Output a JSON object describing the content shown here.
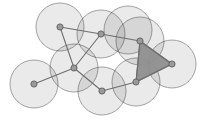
{
  "figure": {
    "name": "disk-cover-simplicial-complex",
    "width": 206,
    "height": 126,
    "background": "#ffffff",
    "caption": ""
  },
  "style": {
    "disk_fill": "#e6e6e6",
    "disk_stroke": "#8c8c8c",
    "disk_stroke_width": 0.8,
    "disk_opacity": 0.85,
    "edge_stroke": "#6e6e6e",
    "edge_width": 1.1,
    "vertex_fill": "#9a9a9a",
    "vertex_stroke": "#5f5f5f",
    "vertex_radius": 3.1,
    "triangle_fill": "#8f8f8f",
    "triangle_stroke": "#6e6e6e",
    "triangle_opacity": 0.95
  },
  "chart_data": {
    "type": "scatter",
    "title": "",
    "xlabel": "",
    "ylabel": "",
    "grid": false,
    "legend": null,
    "xlim": [
      0,
      206
    ],
    "ylim": [
      0,
      126
    ],
    "radius": 24,
    "vertices": [
      {
        "id": "v1",
        "label": "v1",
        "x": 60,
        "y": 27
      },
      {
        "id": "v2",
        "label": "v2",
        "x": 101,
        "y": 34
      },
      {
        "id": "v3",
        "label": "v3",
        "x": 140,
        "y": 41
      },
      {
        "id": "v4",
        "label": "v4",
        "x": 172,
        "y": 64
      },
      {
        "id": "v5",
        "label": "v5",
        "x": 136,
        "y": 82
      },
      {
        "id": "v6",
        "label": "v6",
        "x": 102,
        "y": 91
      },
      {
        "id": "v7",
        "label": "v7",
        "x": 74,
        "y": 68
      },
      {
        "id": "v8",
        "label": "v8",
        "x": 34,
        "y": 84
      }
    ],
    "edges": [
      {
        "from": "v1",
        "to": "v2"
      },
      {
        "from": "v2",
        "to": "v3"
      },
      {
        "from": "v3",
        "to": "v4"
      },
      {
        "from": "v3",
        "to": "v5"
      },
      {
        "from": "v4",
        "to": "v5"
      },
      {
        "from": "v1",
        "to": "v7"
      },
      {
        "from": "v2",
        "to": "v7"
      },
      {
        "from": "v7",
        "to": "v6"
      },
      {
        "from": "v7",
        "to": "v8"
      },
      {
        "from": "v6",
        "to": "v5"
      }
    ],
    "triangles": [
      {
        "vertices": [
          "v3",
          "v4",
          "v5"
        ],
        "filled": true
      }
    ],
    "disks": [
      {
        "cx": 60,
        "cy": 27,
        "r": 24,
        "centered_on": "v1"
      },
      {
        "cx": 101,
        "cy": 34,
        "r": 24,
        "centered_on": "v2"
      },
      {
        "cx": 128,
        "cy": 30,
        "r": 24,
        "centered_on": null
      },
      {
        "cx": 140,
        "cy": 41,
        "r": 24,
        "centered_on": "v3"
      },
      {
        "cx": 172,
        "cy": 64,
        "r": 24,
        "centered_on": "v4"
      },
      {
        "cx": 136,
        "cy": 82,
        "r": 24,
        "centered_on": "v5"
      },
      {
        "cx": 102,
        "cy": 91,
        "r": 24,
        "centered_on": "v6"
      },
      {
        "cx": 74,
        "cy": 68,
        "r": 24,
        "centered_on": "v7"
      },
      {
        "cx": 34,
        "cy": 84,
        "r": 24,
        "centered_on": "v8"
      }
    ]
  }
}
